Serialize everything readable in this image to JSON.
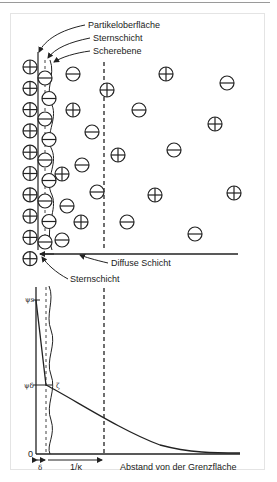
{
  "diagram": {
    "top_labels": {
      "particle_surface": "Partikeloberfläche",
      "stern_layer": "Sternschicht",
      "shear_plane": "Scherebene",
      "diffuse_layer": "Diffuse Schicht",
      "stern_layer_bottom": "Sternschicht"
    },
    "plot": {
      "y_labels": {
        "psi_s": "ψs",
        "psi_delta": "ψδ",
        "zero": "0"
      },
      "zeta_label": "ζ",
      "x_labels": {
        "delta": "δ",
        "debye_length": "1/κ",
        "axis": "Abstand von der Grenzfläche"
      }
    },
    "ions": {
      "fixed_positive_column": [
        "+",
        "+",
        "+",
        "+",
        "+",
        "+",
        "+",
        "+",
        "+",
        "+"
      ],
      "stern_negative_column": [
        "-",
        "-",
        "-",
        "-",
        "-",
        "-",
        "-",
        "-",
        "-"
      ],
      "diffuse_ions": [
        {
          "sign": "-",
          "x": 73,
          "y": 74
        },
        {
          "sign": "+",
          "x": 166,
          "y": 74
        },
        {
          "sign": "-",
          "x": 227,
          "y": 83
        },
        {
          "sign": "+",
          "x": 107,
          "y": 90
        },
        {
          "sign": "-",
          "x": 139,
          "y": 110
        },
        {
          "sign": "+",
          "x": 73,
          "y": 110
        },
        {
          "sign": "-",
          "x": 92,
          "y": 132
        },
        {
          "sign": "+",
          "x": 215,
          "y": 124
        },
        {
          "sign": "+",
          "x": 118,
          "y": 155
        },
        {
          "sign": "-",
          "x": 174,
          "y": 150
        },
        {
          "sign": "-",
          "x": 82,
          "y": 165
        },
        {
          "sign": "+",
          "x": 62,
          "y": 174
        },
        {
          "sign": "-",
          "x": 97,
          "y": 192
        },
        {
          "sign": "+",
          "x": 155,
          "y": 195
        },
        {
          "sign": "+",
          "x": 234,
          "y": 193
        },
        {
          "sign": "-",
          "x": 67,
          "y": 206
        },
        {
          "sign": "+",
          "x": 81,
          "y": 222
        },
        {
          "sign": "-",
          "x": 127,
          "y": 222
        },
        {
          "sign": "-",
          "x": 62,
          "y": 240
        },
        {
          "sign": "-",
          "x": 195,
          "y": 234
        }
      ]
    }
  }
}
